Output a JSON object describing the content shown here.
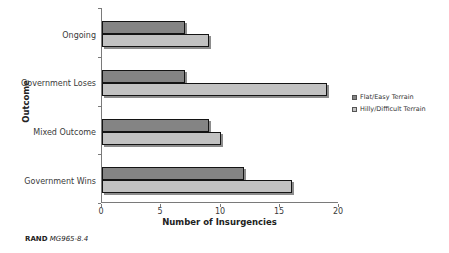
{
  "figure": {
    "background": "#ffffff",
    "credit": {
      "brand": "RAND",
      "reference": "MG965-8.4"
    }
  },
  "chart_data": {
    "type": "bar",
    "orientation": "horizontal",
    "title": "",
    "xlabel": "Number of Insurgencies",
    "ylabel": "Outcome",
    "xlim": [
      0,
      20
    ],
    "x_ticks": [
      0,
      5,
      10,
      15,
      20
    ],
    "grid": false,
    "legend_position": "right",
    "categories": [
      "Ongoing",
      "Government Loses",
      "Mixed Outcome",
      "Government Wins"
    ],
    "series": [
      {
        "name": "Flat/Easy Terrain",
        "color": "#848484",
        "values": [
          7,
          7,
          9,
          12
        ]
      },
      {
        "name": "Hilly/Difficult Terrain",
        "color": "#c2c2c2",
        "values": [
          9,
          19,
          10,
          16
        ]
      }
    ],
    "axis_color": "#7a7a7a",
    "bar_border_color": "#141414"
  }
}
